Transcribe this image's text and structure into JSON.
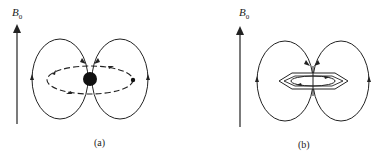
{
  "panels": [
    {
      "id": "a",
      "field_label": "B",
      "field_subscript": "0",
      "caption": "(a)",
      "description": "Spherical atom: electron circulation (dashed ellipse) around nucleus induces field lines (two loops)"
    },
    {
      "id": "b",
      "field_label": "B",
      "field_subscript": "0",
      "caption": "(b)",
      "description": "Benzene ring: ring current in hexagon induces field lines (two loops)"
    }
  ],
  "colors": {
    "line": "#222222",
    "background": "#ffffff"
  }
}
